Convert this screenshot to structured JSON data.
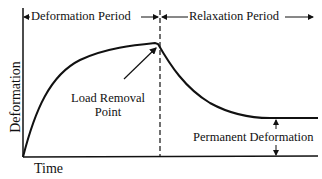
{
  "diagram": {
    "type": "deformation-time curve",
    "axes": {
      "x_label": "Time",
      "y_label": "Deformation"
    },
    "periods": {
      "left": "Deformation Period",
      "right": "Relaxation Period"
    },
    "annotations": {
      "load_removal_line1": "Load Removal",
      "load_removal_line2": "Point",
      "permanent": "Permanent Deformation"
    },
    "colors": {
      "line": "#111111",
      "background": "#ffffff"
    }
  }
}
